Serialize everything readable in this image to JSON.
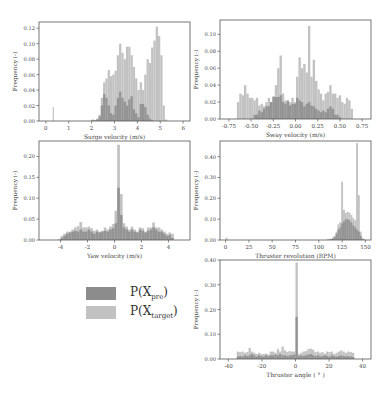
{
  "colors": {
    "pre": "#8c8c8c",
    "target": "#c2c2c2",
    "axis": "#555555",
    "text": "#444444"
  },
  "legend": {
    "entries": [
      {
        "label_main": "P(X",
        "label_sub": "pre",
        "label_end": ")",
        "color": "#8c8c8c"
      },
      {
        "label_main": "P(X",
        "label_sub": "target",
        "label_end": ")",
        "color": "#c2c2c2"
      }
    ]
  },
  "chart_data": [
    {
      "id": "surge",
      "type": "bar",
      "title": "",
      "xlabel": "Surge velocity (m/s)",
      "ylabel": "Frequency (-)",
      "box": {
        "x": 39,
        "y": 22,
        "w": 151,
        "h": 99
      },
      "xlim": [
        -0.3,
        6.3
      ],
      "ylim": [
        0,
        0.128
      ],
      "xticks": [
        0,
        1,
        2,
        3,
        4,
        5,
        6
      ],
      "xticklabels": [
        "0",
        "1",
        "2",
        "3",
        "4",
        "5",
        "6"
      ],
      "yticks": [
        0,
        0.02,
        0.04,
        0.06,
        0.08,
        0.1,
        0.12
      ],
      "yticklabels": [
        "0.00",
        "0.02",
        "0.04",
        "0.06",
        "0.08",
        "0.10",
        "0.12"
      ],
      "bin_start": 2.0,
      "bin_width": 0.1,
      "series": [
        {
          "name": "P(X_target)",
          "values": [
            0.002,
            0.001,
            0.003,
            0.008,
            0.03,
            0.05,
            0.055,
            0.066,
            0.058,
            0.06,
            0.065,
            0.085,
            0.1,
            0.088,
            0.08,
            0.096,
            0.096,
            0.085,
            0.07,
            0.055,
            0.04,
            0.05,
            0.04,
            0.06,
            0.08,
            0.075,
            0.095,
            0.104,
            0.122,
            0.11,
            0.085,
            0.02,
            0.002
          ]
        },
        {
          "name": "P(X_pre)",
          "values": [
            0.001,
            0.001,
            0.002,
            0.006,
            0.02,
            0.035,
            0.03,
            0.02,
            0.01,
            0.008,
            0.02,
            0.03,
            0.038,
            0.03,
            0.025,
            0.02,
            0.028,
            0.032,
            0.015,
            0.01,
            0.005,
            0.022,
            0.022,
            0.018,
            0.008,
            0.003,
            0.001,
            0,
            0,
            0,
            0,
            0,
            0
          ]
        }
      ],
      "extra_bars": [
        {
          "series": "P(X_target)",
          "x": 0.3,
          "width": 0.05,
          "value": 0.018
        }
      ]
    },
    {
      "id": "sway",
      "type": "bar",
      "title": "",
      "xlabel": "Sway velocity (m/s)",
      "ylabel": "Frequency (-)",
      "box": {
        "x": 220,
        "y": 20,
        "w": 151,
        "h": 99
      },
      "xlim": [
        -0.85,
        0.85
      ],
      "ylim": [
        0,
        0.117
      ],
      "xticks": [
        -0.75,
        -0.5,
        -0.25,
        0.0,
        0.25,
        0.5,
        0.75
      ],
      "xticklabels": [
        "-0.75",
        "-0.50",
        "-0.25",
        "0.00",
        "0.25",
        "0.50",
        "0.75"
      ],
      "yticks": [
        0,
        0.02,
        0.04,
        0.06,
        0.08,
        0.1
      ],
      "yticklabels": [
        "0.00",
        "0.02",
        "0.04",
        "0.06",
        "0.08",
        "0.10"
      ],
      "bin_start": -0.66,
      "bin_width": 0.02667,
      "series": [
        {
          "name": "P(X_target)",
          "values": [
            0.02,
            0.03,
            0.028,
            0.04,
            0.03,
            0.025,
            0.025,
            0.022,
            0.025,
            0.016,
            0.018,
            0.015,
            0.02,
            0.025,
            0.02,
            0.027,
            0.04,
            0.06,
            0.075,
            0.03,
            0.022,
            0.02,
            0.02,
            0.025,
            0.02,
            0.05,
            0.073,
            0.06,
            0.065,
            0.055,
            0.11,
            0.05,
            0.07,
            0.045,
            0.035,
            0.03,
            0.022,
            0.03,
            0.032,
            0.04,
            0.03,
            0.03,
            0.025,
            0.028,
            0.02,
            0.018,
            0.025,
            0.022,
            0.012
          ]
        },
        {
          "name": "P(X_pre)",
          "values": [
            0,
            0,
            0,
            0,
            0,
            0,
            0,
            0.005,
            0.005,
            0.01,
            0.008,
            0.012,
            0.015,
            0.015,
            0.02,
            0.026,
            0.026,
            0.026,
            0.028,
            0.02,
            0.018,
            0.022,
            0.016,
            0.018,
            0.018,
            0.025,
            0.022,
            0.02,
            0.015,
            0.018,
            0.02,
            0.016,
            0.015,
            0.012,
            0.01,
            0.008,
            0.01,
            0.008,
            0.012,
            0.015,
            0.012,
            0.005,
            0.005,
            0.002,
            0,
            0,
            0,
            0,
            0
          ]
        }
      ]
    },
    {
      "id": "yaw",
      "type": "bar",
      "title": "",
      "xlabel": "Yaw velocity (m/s)",
      "ylabel": "Frequency (-)",
      "box": {
        "x": 39,
        "y": 141,
        "w": 151,
        "h": 99
      },
      "xlim": [
        -5.6,
        5.6
      ],
      "ylim": [
        0,
        0.237
      ],
      "xticks": [
        -4,
        -2,
        0,
        2,
        4
      ],
      "xticklabels": [
        "-4",
        "-2",
        "0",
        "2",
        "4"
      ],
      "yticks": [
        0,
        0.05,
        0.1,
        0.15,
        0.2
      ],
      "yticklabels": [
        "0.00",
        "0.05",
        "0.10",
        "0.15",
        "0.20"
      ],
      "bin_start": -4.2,
      "bin_width": 0.2,
      "series": [
        {
          "name": "P(X_target)",
          "values": [
            0.002,
            0.01,
            0.015,
            0.02,
            0.02,
            0.025,
            0.03,
            0.033,
            0.043,
            0.03,
            0.03,
            0.032,
            0.028,
            0.022,
            0.025,
            0.02,
            0.022,
            0.03,
            0.025,
            0.032,
            0.038,
            0.07,
            0.228,
            0.11,
            0.04,
            0.032,
            0.025,
            0.032,
            0.025,
            0.02,
            0.03,
            0.028,
            0.02,
            0.03,
            0.03,
            0.042,
            0.03,
            0.03,
            0.025,
            0.02,
            0.015,
            0.018,
            0.015
          ]
        },
        {
          "name": "P(X_pre)",
          "values": [
            0,
            0.005,
            0.01,
            0.015,
            0.018,
            0.02,
            0.022,
            0.02,
            0.025,
            0.02,
            0.02,
            0.025,
            0.02,
            0.015,
            0.02,
            0.018,
            0.02,
            0.022,
            0.02,
            0.025,
            0.028,
            0.04,
            0.125,
            0.06,
            0.03,
            0.025,
            0.02,
            0.025,
            0.02,
            0.018,
            0.025,
            0.022,
            0.018,
            0.022,
            0.025,
            0.03,
            0.025,
            0.02,
            0.02,
            0.015,
            0.01,
            0.012,
            0.005
          ]
        }
      ]
    },
    {
      "id": "thruster_rev",
      "type": "bar",
      "title": "",
      "xlabel": "Thruster revolution (RPM)",
      "ylabel": "Frequency (-)",
      "box": {
        "x": 220,
        "y": 141,
        "w": 151,
        "h": 99
      },
      "xlim": [
        -6,
        156
      ],
      "ylim": [
        0,
        0.475
      ],
      "xticks": [
        0,
        25,
        50,
        75,
        100,
        125,
        150
      ],
      "xticklabels": [
        "0",
        "25",
        "50",
        "75",
        "100",
        "125",
        "150"
      ],
      "yticks": [
        0,
        0.1,
        0.2,
        0.3,
        0.4
      ],
      "yticklabels": [
        "0.00",
        "0.10",
        "0.20",
        "0.30",
        "0.40"
      ],
      "bin_start": 108,
      "bin_width": 2,
      "series": [
        {
          "name": "P(X_target)",
          "values": [
            0.002,
            0.003,
            0.005,
            0.01,
            0.02,
            0.04,
            0.075,
            0.085,
            0.28,
            0.145,
            0.13,
            0.135,
            0.13,
            0.12,
            0.105,
            0.095,
            0.465,
            0.215,
            0.04,
            0.01,
            0.003
          ]
        },
        {
          "name": "P(X_pre)",
          "values": [
            0.001,
            0.002,
            0.004,
            0.008,
            0.015,
            0.03,
            0.05,
            0.06,
            0.08,
            0.09,
            0.1,
            0.1,
            0.095,
            0.085,
            0.07,
            0.06,
            0.05,
            0.04,
            0.02,
            0.005,
            0.001
          ]
        }
      ],
      "extra_bars": [
        {
          "series": "P(X_target)",
          "x": 0,
          "width": 2,
          "value": 0.012
        }
      ]
    },
    {
      "id": "thruster_angle",
      "type": "bar",
      "title": "",
      "xlabel": "Thruster angle ( ° )",
      "ylabel": "Frequency (-)",
      "box": {
        "x": 220,
        "y": 260,
        "w": 151,
        "h": 99
      },
      "xlim": [
        -45,
        45
      ],
      "ylim": [
        0,
        0.4
      ],
      "xticks": [
        -40,
        -20,
        0,
        20,
        40
      ],
      "xticklabels": [
        "-40",
        "-20",
        "0",
        "20",
        "40"
      ],
      "yticks": [
        0,
        0.1,
        0.2,
        0.3,
        0.4
      ],
      "yticklabels": [
        "0.00",
        "0.10",
        "0.20",
        "0.30",
        "0.40"
      ],
      "bin_start": -35,
      "bin_width": 1.4,
      "series": [
        {
          "name": "P(X_target)",
          "values": [
            0.03,
            0.028,
            0.03,
            0.025,
            0.028,
            0.045,
            0.03,
            0.025,
            0.02,
            0.025,
            0.02,
            0.02,
            0.022,
            0.018,
            0.03,
            0.03,
            0.025,
            0.04,
            0.03,
            0.05,
            0.035,
            0.028,
            0.032,
            0.03,
            0.03,
            0.39,
            0.02,
            0.025,
            0.03,
            0.032,
            0.04,
            0.042,
            0.038,
            0.028,
            0.03,
            0.025,
            0.028,
            0.022,
            0.03,
            0.028,
            0.03,
            0.02,
            0.025,
            0.03,
            0.035,
            0.03,
            0.025,
            0.03,
            0.028,
            0.025
          ]
        },
        {
          "name": "P(X_pre)",
          "values": [
            0.01,
            0.012,
            0.01,
            0.015,
            0.012,
            0.015,
            0.02,
            0.015,
            0.01,
            0.015,
            0.012,
            0.01,
            0.015,
            0.012,
            0.015,
            0.015,
            0.018,
            0.015,
            0.02,
            0.015,
            0.015,
            0.012,
            0.015,
            0.015,
            0.018,
            0.17,
            0.012,
            0.015,
            0.012,
            0.015,
            0.018,
            0.02,
            0.015,
            0.012,
            0.015,
            0.01,
            0.012,
            0.015,
            0.012,
            0.01,
            0.015,
            0.012,
            0.01,
            0.012,
            0.015,
            0.012,
            0.01,
            0.012,
            0.01,
            0.008
          ]
        }
      ]
    }
  ]
}
